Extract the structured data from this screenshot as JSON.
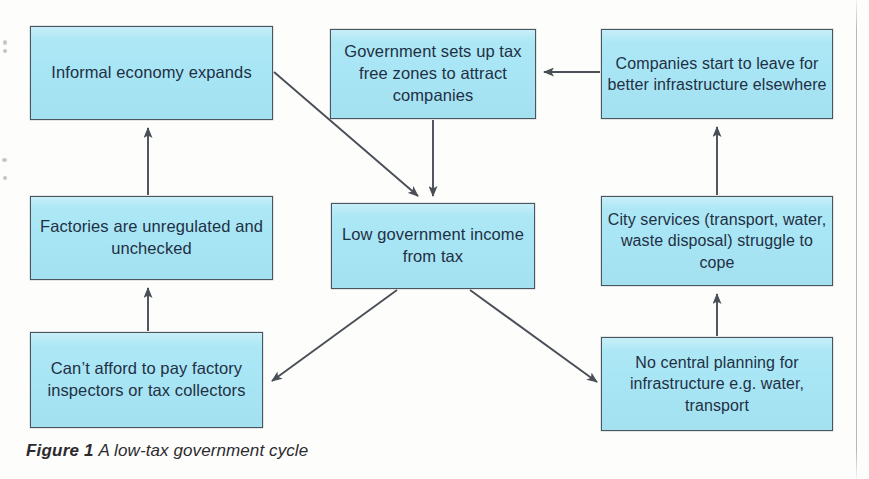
{
  "figure": {
    "caption_label": "Figure 1",
    "caption_text": "A low-tax government cycle",
    "box_fill_color": "#a9e6f5",
    "box_border_color": "#4a5560",
    "text_color": "#1f3044",
    "arrow_color": "#4a4f57",
    "background_color": "#fdfdfc"
  },
  "nodes": {
    "informal_economy": "Informal economy expands",
    "tax_free_zones": "Government sets up tax free zones to attract companies",
    "companies_leave": "Companies start to leave for better infrastructure elsewhere",
    "factories_unregulated": "Factories are unregulated and unchecked",
    "low_government_income": "Low government income from tax",
    "city_services": "City services (transport, water, waste disposal) struggle to cope",
    "cant_afford": "Can’t afford to pay factory inspectors or tax collectors",
    "no_central_planning": "No central planning for infrastructure e.g. water, transport"
  },
  "edges": [
    {
      "from": "informal_economy",
      "to": "low_government_income",
      "style": "diagonal-down-right"
    },
    {
      "from": "tax_free_zones",
      "to": "low_government_income",
      "style": "vertical-down"
    },
    {
      "from": "companies_leave",
      "to": "tax_free_zones",
      "style": "horizontal-left"
    },
    {
      "from": "low_government_income",
      "to": "cant_afford",
      "style": "diagonal-down-left"
    },
    {
      "from": "low_government_income",
      "to": "no_central_planning",
      "style": "diagonal-down-right"
    },
    {
      "from": "cant_afford",
      "to": "factories_unregulated",
      "style": "vertical-up"
    },
    {
      "from": "factories_unregulated",
      "to": "informal_economy",
      "style": "vertical-up"
    },
    {
      "from": "no_central_planning",
      "to": "city_services",
      "style": "vertical-up"
    },
    {
      "from": "city_services",
      "to": "companies_leave",
      "style": "vertical-up"
    }
  ]
}
